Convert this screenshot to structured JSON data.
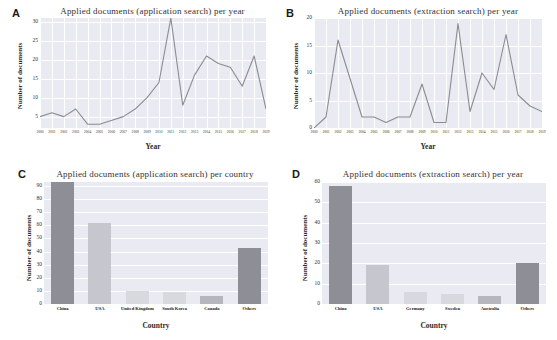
{
  "figure": {
    "panels": [
      "A",
      "B",
      "C",
      "D"
    ],
    "axis_titles": {
      "y_documents": "Number of documents",
      "x_year": "Year",
      "x_country": "Country"
    }
  },
  "panelA": {
    "letter": "A",
    "title": "Applied  documents (application search) per year",
    "chart_data": {
      "type": "line",
      "title": "Applied  documents (application search) per year",
      "xlabel": "Year",
      "ylabel": "Number of documents",
      "x": [
        "2000",
        "2001",
        "2002",
        "2003",
        "2004",
        "2005",
        "2006",
        "2007",
        "2008",
        "2009",
        "2010",
        "2011",
        "2012",
        "2013",
        "2014",
        "2015",
        "2016",
        "2017",
        "2018",
        "2019"
      ],
      "values": [
        5,
        6,
        5,
        7,
        3,
        3,
        4,
        5,
        7,
        10,
        14,
        31,
        8,
        16,
        21,
        19,
        18,
        13,
        21,
        7
      ],
      "ylim": [
        2,
        31
      ],
      "yticks": [
        5,
        10,
        15,
        20,
        25,
        30
      ],
      "grid": true,
      "line_color": "#8b8b93"
    }
  },
  "panelB": {
    "letter": "B",
    "title": "Applied  documents (extraction search) per year",
    "chart_data": {
      "type": "line",
      "title": "Applied  documents (extraction search) per year",
      "xlabel": "Year",
      "ylabel": "Number of documents",
      "x": [
        "2000",
        "2001",
        "2002",
        "2003",
        "2004",
        "2005",
        "2006",
        "2007",
        "2008",
        "2009",
        "2010",
        "2011",
        "2012",
        "2013",
        "2014",
        "2015",
        "2016",
        "2017",
        "2018",
        "2019"
      ],
      "values": [
        0,
        2,
        16,
        9,
        2,
        2,
        1,
        2,
        2,
        8,
        1,
        1,
        19,
        3,
        10,
        7,
        17,
        6,
        4,
        3
      ],
      "ylim": [
        0,
        20
      ],
      "yticks": [
        0,
        5,
        10,
        15,
        20
      ],
      "grid": true,
      "line_color": "#8b8b93"
    }
  },
  "panelC": {
    "letter": "C",
    "title": "Applied  documents (application search) per country",
    "chart_data": {
      "type": "bar",
      "title": "Applied  documents (application search) per country",
      "xlabel": "Country",
      "ylabel": "Number of documents",
      "categories": [
        "China",
        "USA",
        "United Kingdom",
        "South Korea",
        "Canada",
        "Others"
      ],
      "values": [
        93,
        62,
        10,
        9,
        6,
        43
      ],
      "ylim": [
        0,
        93
      ],
      "yticks": [
        0,
        10,
        20,
        30,
        40,
        50,
        60,
        70,
        80,
        90
      ],
      "grid": true,
      "bar_colors": [
        "#8e8e96",
        "#c6c6cf",
        "#d8d8df",
        "#d8d8df",
        "#b6b6bf",
        "#8e8e96"
      ]
    }
  },
  "panelD": {
    "letter": "D",
    "title": "Applied  documents (extraction search) per year",
    "chart_data": {
      "type": "bar",
      "title": "Applied  documents (extraction search) per year",
      "xlabel": "Country",
      "ylabel": "Number of documents",
      "categories": [
        "China",
        "USA",
        "Germany",
        "Sweden",
        "Australia",
        "Others"
      ],
      "values": [
        58,
        19,
        6,
        5,
        4,
        20
      ],
      "ylim": [
        0,
        60
      ],
      "yticks": [
        0,
        10,
        20,
        30,
        40,
        50,
        60
      ],
      "grid": true,
      "bar_colors": [
        "#8e8e96",
        "#c6c6cf",
        "#d8d8df",
        "#d8d8df",
        "#b6b6bf",
        "#8e8e96"
      ]
    }
  }
}
